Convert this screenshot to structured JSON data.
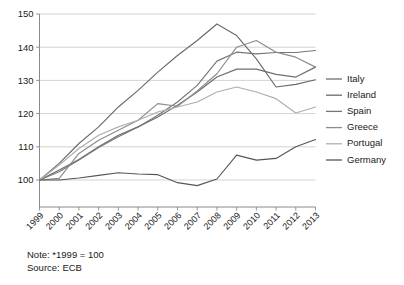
{
  "chart_data": {
    "type": "line",
    "title": "",
    "subtitle": "",
    "xlabel": "",
    "ylabel": "",
    "x": [
      "1999",
      "2000",
      "2001",
      "2002",
      "2003",
      "2004",
      "2005",
      "2006",
      "2007",
      "2008",
      "2009",
      "2010",
      "2011",
      "2012",
      "2013"
    ],
    "xlim": [
      1999,
      2013
    ],
    "ylim": [
      100,
      150
    ],
    "yticks": [
      100,
      110,
      120,
      130,
      140,
      150
    ],
    "ytick_labels": [
      "100",
      "110",
      "120",
      "130",
      "140",
      "150"
    ],
    "xtick_labels": [
      "1999",
      "2000",
      "2001",
      "2002",
      "2003",
      "2004",
      "2005",
      "2006",
      "2007",
      "2008",
      "2009",
      "2010",
      "2011",
      "2012",
      "2013"
    ],
    "grid": true,
    "grid_axis": "y",
    "legend_position": "right",
    "series": [
      {
        "name": "Italy",
        "color": "#6e6e6e",
        "values": [
          100.0,
          103.0,
          106.2,
          110.0,
          113.5,
          116.0,
          119.0,
          122.5,
          126.5,
          131.0,
          133.4,
          133.4,
          131.8,
          131.0,
          134.0
        ]
      },
      {
        "name": "Ireland",
        "color": "#6a6a6a",
        "values": [
          100.0,
          105.0,
          111.0,
          116.0,
          122.0,
          127.0,
          132.5,
          137.5,
          142.0,
          147.0,
          143.5,
          136.5,
          128.0,
          128.8,
          130.2
        ]
      },
      {
        "name": "Spain",
        "color": "#767676",
        "values": [
          100.0,
          102.5,
          106.0,
          109.8,
          113.0,
          116.0,
          119.5,
          123.5,
          128.5,
          135.8,
          138.5,
          138.0,
          138.4,
          138.4,
          139.0
        ]
      },
      {
        "name": "Greece",
        "color": "#8c8c8c",
        "values": [
          100.0,
          100.5,
          108.0,
          112.0,
          115.0,
          118.0,
          123.0,
          122.2,
          126.8,
          132.0,
          140.0,
          142.0,
          138.5,
          137.0,
          134.0
        ]
      },
      {
        "name": "Portugal",
        "color": "#aeaeae",
        "values": [
          100.0,
          104.5,
          109.5,
          113.5,
          116.0,
          118.0,
          120.5,
          122.0,
          123.5,
          126.5,
          128.0,
          126.5,
          124.5,
          120.2,
          122.0
        ]
      },
      {
        "name": "Germany",
        "color": "#565656",
        "values": [
          100.0,
          100.0,
          100.6,
          101.4,
          102.2,
          101.8,
          101.6,
          99.2,
          98.3,
          100.3,
          107.5,
          106.0,
          106.5,
          110.0,
          112.2
        ]
      }
    ]
  },
  "notes": {
    "note_line": "Note: *1999 = 100",
    "source_line": "Source: ECB"
  },
  "legend": {
    "entries": [
      "Italy",
      "Ireland",
      "Spain",
      "Greece",
      "Portugal",
      "Germany"
    ]
  },
  "axes": {
    "y_tick_labels": [
      "150",
      "140",
      "130",
      "120",
      "110",
      "100"
    ],
    "x_tick_labels": [
      "1999",
      "2000",
      "2001",
      "2002",
      "2003",
      "2004",
      "2005",
      "2006",
      "2007",
      "2008",
      "2009",
      "2010",
      "2011",
      "2012",
      "2013"
    ]
  }
}
